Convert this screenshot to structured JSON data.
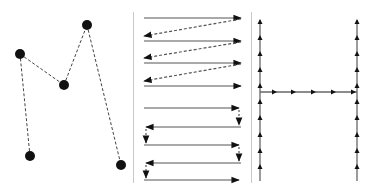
{
  "diagram": {
    "title": "",
    "panels": [
      {
        "id": "random-order",
        "description": "Points visited in arbitrary order connected by dashed path",
        "points": [
          [
            30,
            156
          ],
          [
            20,
            54
          ],
          [
            64,
            85
          ],
          [
            87,
            25
          ],
          [
            121,
            165
          ]
        ],
        "point_radius": 5,
        "line_style": "dashed"
      },
      {
        "id": "raster-scan",
        "description": "Top: zigzag raster (solid forward, dashed retrace). Bottom: boustrophedon serpentine with short dashed down steps.",
        "zigzag_rows_y": [
          18,
          41,
          63,
          86
        ],
        "serpentine_rows_y": [
          108,
          127,
          145,
          163,
          180
        ],
        "x_left": 144,
        "x_right": 241
      },
      {
        "id": "h-path",
        "description": "H-shaped path: two vertical lines with upward arrows, one horizontal crossbar with rightward arrows",
        "left_x": 260,
        "right_x": 357,
        "y_top": 20,
        "y_bottom": 181,
        "crossbar_y": 92,
        "vertical_arrow_y": [
          21,
          37,
          53,
          69,
          85,
          101,
          117,
          134,
          150,
          166
        ],
        "crossbar_arrow_x": [
          276,
          295,
          315,
          335,
          355
        ]
      }
    ],
    "dividers_x": [
      133,
      251
    ],
    "colors": {
      "ink": "#111111",
      "line": "#555555",
      "divider": "#c8c8c8"
    }
  }
}
